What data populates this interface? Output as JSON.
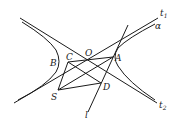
{
  "diagram": {
    "title": "",
    "labels": {
      "t1": "t",
      "t1_sub": "1",
      "t2": "t",
      "t2_sub": "2",
      "alpha": "α",
      "O": "O",
      "A": "A",
      "B": "B",
      "C": "C",
      "D": "D",
      "S": "S",
      "l": "l"
    },
    "points": {
      "O": [
        88,
        62
      ],
      "A": [
        113,
        57
      ],
      "B": [
        60,
        62
      ],
      "C": [
        68,
        62
      ],
      "D": [
        101,
        83
      ],
      "S": [
        58,
        90
      ]
    },
    "elements": [
      "hyperbola-left-branch",
      "hyperbola-right-branch",
      "asymptote-t1",
      "asymptote-t2",
      "line-l",
      "segments"
    ]
  }
}
